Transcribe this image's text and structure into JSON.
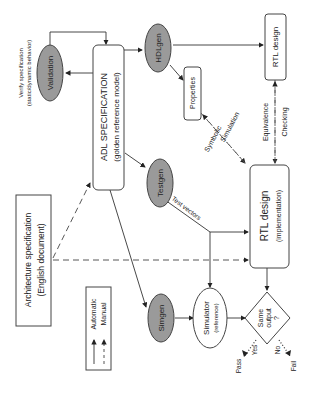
{
  "nodes": {
    "adl_spec": {
      "line1": "ADL SPECIFICATION",
      "line2": "(golden reference model)"
    },
    "validation": {
      "label": "Validation"
    },
    "validation_note": {
      "line1": "Verify specification",
      "line2": "(static/dynamic behavior)"
    },
    "hdlgen": {
      "label": "HDLgen"
    },
    "properties": {
      "label": "Properties"
    },
    "rtl_design_top": {
      "label": "RTL design"
    },
    "testgen": {
      "label": "Testgen"
    },
    "simgen": {
      "label": "Simgen"
    },
    "rtl_impl": {
      "line1": "RTL design",
      "line2": "(implementation)"
    },
    "simulator": {
      "line1": "Simulator",
      "line2": "(reference)"
    },
    "decision": {
      "line1": "Same",
      "line2": "output",
      "line3": "?"
    },
    "arch_spec": {
      "line1": "Architecture specification",
      "line2": "(English document)"
    }
  },
  "edge_labels": {
    "symbolic": "Symbolic",
    "simulation": "Simulation",
    "equivalence": "Equivalence",
    "checking": "Checking",
    "test_vectors": "Test vectors",
    "yes": "Yes",
    "no": "No",
    "pass": "Pass",
    "fail": "Fail"
  },
  "legend": {
    "automatic": "Automatic",
    "manual": "Manual"
  }
}
